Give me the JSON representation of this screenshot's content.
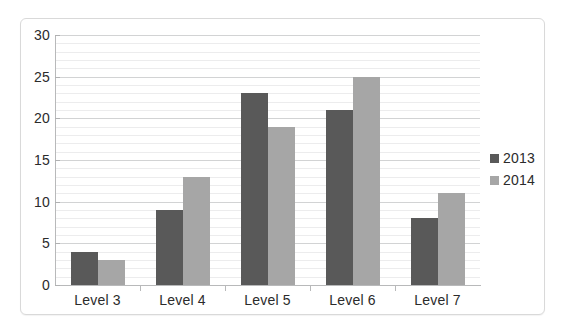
{
  "chart_data": {
    "type": "bar",
    "title": "",
    "xlabel": "",
    "ylabel": "",
    "categories": [
      "Level 3",
      "Level 4",
      "Level 5",
      "Level 6",
      "Level 7"
    ],
    "series": [
      {
        "name": "2013",
        "color": "#595959",
        "values": [
          4,
          9,
          23,
          21,
          8
        ]
      },
      {
        "name": "2014",
        "color": "#a6a6a6",
        "values": [
          3,
          13,
          19,
          25,
          11
        ]
      }
    ],
    "ylim": [
      0,
      30
    ],
    "y_ticks": [
      0,
      5,
      10,
      15,
      20,
      25,
      30
    ],
    "y_tick_labels": [
      "0",
      "5",
      "10",
      "15",
      "20",
      "25",
      "30"
    ],
    "minor_tick_step": 1,
    "grid": true,
    "grid_axis": "y",
    "legend_position": "right",
    "legend_entries": [
      "2013",
      "2014"
    ]
  },
  "legend": {
    "items": [
      {
        "label": "2013",
        "swatch": "legend-swatch-2013"
      },
      {
        "label": "2014",
        "swatch": "legend-swatch-2014"
      }
    ]
  }
}
